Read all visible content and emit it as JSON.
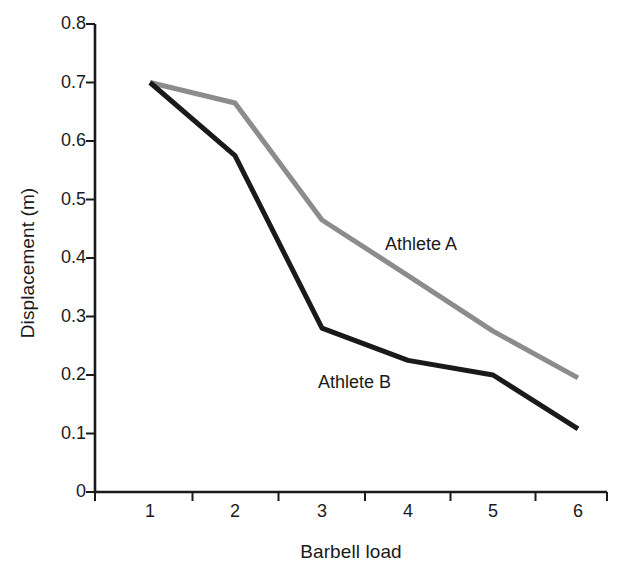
{
  "chart_data": {
    "type": "line",
    "title": "",
    "xlabel": "Barbell load",
    "ylabel": "Displacement (m)",
    "categories": [
      "1",
      "2",
      "3",
      "4",
      "5",
      "6"
    ],
    "ylim": [
      0,
      0.8
    ],
    "yticks": [
      "0",
      "0.1",
      "0.2",
      "0.3",
      "0.4",
      "0.5",
      "0.6",
      "0.7",
      "0.8"
    ],
    "ytick_values": [
      0,
      0.1,
      0.2,
      0.3,
      0.4,
      0.5,
      0.6,
      0.7,
      0.8
    ],
    "grid": false,
    "legend_position": "inline-annotation",
    "series": [
      {
        "name": "Athlete A",
        "color": "#8c8c8c",
        "values": [
          0.7,
          0.665,
          0.465,
          0.37,
          0.275,
          0.195
        ]
      },
      {
        "name": "Athlete B",
        "color": "#1a1a1a",
        "values": [
          0.7,
          0.575,
          0.28,
          0.225,
          0.2,
          0.108
        ]
      }
    ],
    "annotations": [
      {
        "text": "Athlete A",
        "x_px": 385,
        "y_px": 234
      },
      {
        "text": "Athlete B",
        "x_px": 318,
        "y_px": 372
      }
    ]
  },
  "axes": {
    "axis_color": "#1a1a1a",
    "x_axis_y_px": 492,
    "y_axis_x_px": 95,
    "plot_right_px": 607,
    "plot_top_px": 24,
    "category_x_px": [
      150,
      235,
      322,
      408,
      493,
      578
    ]
  }
}
